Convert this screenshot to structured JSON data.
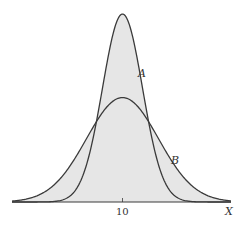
{
  "chart_data": {
    "type": "area",
    "title": "",
    "xlabel": "X",
    "ylabel": "",
    "x_ticks": [
      {
        "value": 10,
        "label": "10"
      }
    ],
    "grid": false,
    "legend": "none (curves labeled inline)",
    "series": [
      {
        "name": "A",
        "distribution": "normal",
        "mean": 10,
        "sd": 1.0,
        "relative_peak": 1.0,
        "label_position": "right side of curve, upper middle"
      },
      {
        "name": "B",
        "distribution": "normal",
        "mean": 10,
        "sd": 1.8,
        "relative_peak": 0.56,
        "label_position": "right tail, lower"
      }
    ],
    "annotations": [
      "A",
      "B"
    ],
    "colors": {
      "fill": "#e6e6e6",
      "stroke": "#3a3a3a",
      "background": "#ffffff"
    }
  },
  "labels": {
    "curve_a": "A",
    "curve_b": "B",
    "tick_10": "10",
    "x_axis": "X"
  }
}
